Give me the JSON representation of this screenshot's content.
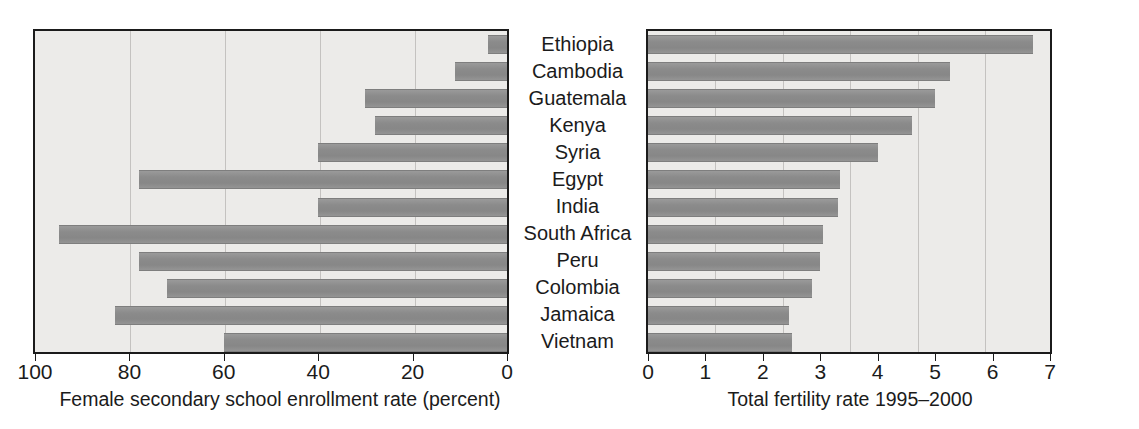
{
  "chart_data": {
    "type": "bar",
    "title": "",
    "orientation": "horizontal",
    "layout": "paired back-to-back (population pyramid style)",
    "categories": [
      "Ethiopia",
      "Cambodia",
      "Guatemala",
      "Kenya",
      "Syria",
      "Egypt",
      "India",
      "South Africa",
      "Peru",
      "Colombia",
      "Jamaica",
      "Vietnam"
    ],
    "panels": [
      {
        "id": "left",
        "xlabel": "Female secondary school enrollment rate (percent)",
        "direction": "right-to-left",
        "xlim": [
          100,
          0
        ],
        "ticks": [
          100,
          80,
          60,
          40,
          20,
          0
        ],
        "tick_labels": [
          "100",
          "80",
          "60",
          "40",
          "20",
          "0"
        ],
        "grid": true,
        "values": [
          4,
          11,
          30,
          28,
          40,
          78,
          40,
          95,
          78,
          72,
          83,
          60
        ]
      },
      {
        "id": "right",
        "xlabel": "Total fertility rate 1995–2000",
        "direction": "left-to-right",
        "xlim": [
          0,
          7
        ],
        "ticks": [
          0,
          1,
          2,
          3,
          4,
          5,
          6,
          7
        ],
        "tick_labels": [
          "0",
          "1",
          "2",
          "3",
          "4",
          "5",
          "6",
          "7"
        ],
        "grid": true,
        "values": [
          6.7,
          5.25,
          5.0,
          4.6,
          4.0,
          3.35,
          3.3,
          3.05,
          3.0,
          2.85,
          2.45,
          2.5
        ]
      }
    ],
    "colors": {
      "bar": "#8b8b8b",
      "plot_background": "#ecebe9",
      "gridline": "#c4c2c0",
      "frame": "#1b1b1b",
      "text": "#1b1b1b",
      "page_background": "#ffffff"
    }
  }
}
